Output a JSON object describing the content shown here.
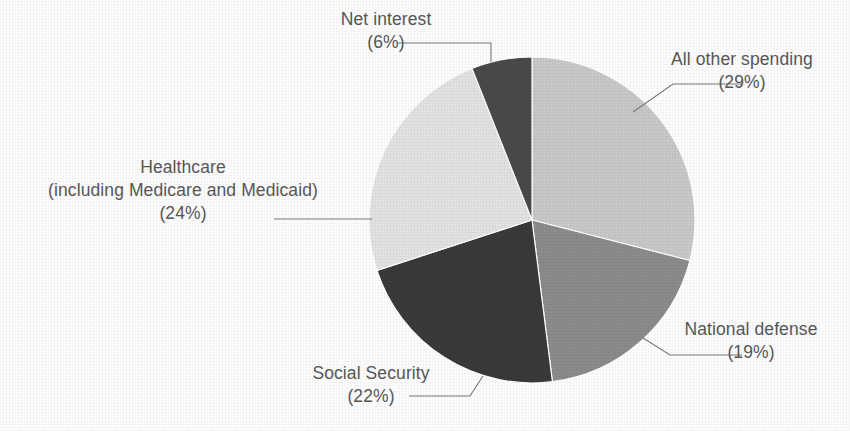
{
  "chart_data": {
    "type": "pie",
    "title": "",
    "subtitle": "",
    "xlabel": "",
    "ylabel": "",
    "legend_position": "none",
    "grid": false,
    "units": "percent",
    "total": 100,
    "categories": [
      "All other spending",
      "National defense",
      "Social Security",
      "Healthcare (including Medicare and Medicaid)",
      "Net interest"
    ],
    "values": [
      29,
      19,
      22,
      24,
      6
    ],
    "start_angle_deg": 0,
    "direction": "clockwise",
    "slices": [
      {
        "name": "all-other-spending",
        "label_line1": "All other spending",
        "label_line2": "(29%)",
        "value": 29,
        "color": "#c9c9c9",
        "start_deg": 0,
        "end_deg": 104.4
      },
      {
        "name": "national-defense",
        "label_line1": "National defense",
        "label_line2": "(19%)",
        "value": 19,
        "color": "#8c8c8c",
        "start_deg": 104.4,
        "end_deg": 172.8
      },
      {
        "name": "social-security",
        "label_line1": "Social Security",
        "label_line2": "(22%)",
        "value": 22,
        "color": "#3a3a3a",
        "start_deg": 172.8,
        "end_deg": 252.0
      },
      {
        "name": "healthcare",
        "label_line1": "Healthcare",
        "label_line2": "(including Medicare and Medicaid)",
        "label_line3": "(24%)",
        "value": 24,
        "color": "#e3e3e3",
        "start_deg": 252.0,
        "end_deg": 338.4
      },
      {
        "name": "net-interest",
        "label_line1": "Net interest",
        "label_line2": "(6%)",
        "value": 6,
        "color": "#4a4a4a",
        "start_deg": 338.4,
        "end_deg": 360.0
      }
    ]
  },
  "labels": {
    "net_interest": {
      "name": "Net interest",
      "pct": "(6%)"
    },
    "all_other_spending": {
      "name": "All other spending",
      "pct": "(29%)"
    },
    "healthcare": {
      "name": "Healthcare",
      "detail": "(including Medicare and Medicaid)",
      "pct": "(24%)"
    },
    "social_security": {
      "name": "Social Security",
      "pct": "(22%)"
    },
    "national_defense": {
      "name": "National defense",
      "pct": "(19%)"
    }
  },
  "style": {
    "background": "#fefefe",
    "text_color": "#58585a",
    "leader_line_color": "#7a7a7a",
    "slice_edge_color": "#ffffff"
  }
}
